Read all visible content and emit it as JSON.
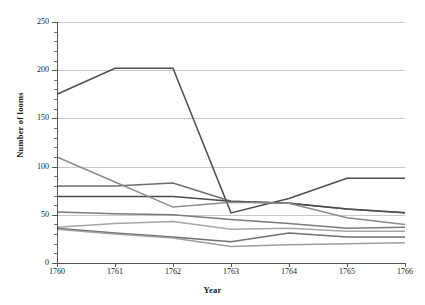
{
  "chart_data": {
    "type": "line",
    "title": "",
    "xlabel": "Year",
    "ylabel": "Number of looms",
    "categories": [
      1760,
      1761,
      1762,
      1763,
      1764,
      1765,
      1766
    ],
    "x_tick_labels": [
      "1760",
      "1761",
      "1762",
      "1763",
      "1764",
      "1765",
      "1766"
    ],
    "y_tick_labels": [
      "0",
      "50",
      "100",
      "150",
      "200",
      "250"
    ],
    "y_ticks": [
      0,
      50,
      100,
      150,
      200,
      250
    ],
    "ylim": [
      0,
      250
    ],
    "xlim": [
      1760,
      1766
    ],
    "grid": "horizontal",
    "legend": "none",
    "series": [
      {
        "name": "series-1",
        "color": "#4d4d4d",
        "values": [
          175,
          202,
          202,
          52,
          67,
          88,
          88
        ]
      },
      {
        "name": "series-2",
        "color": "#6e6e6e",
        "values": [
          80,
          80,
          83,
          64,
          62,
          56,
          52
        ]
      },
      {
        "name": "series-3",
        "color": "#4a4a4a",
        "values": [
          69,
          69,
          69,
          64,
          62,
          56,
          52
        ]
      },
      {
        "name": "series-4",
        "color": "#8c8c8c",
        "values": [
          110,
          84,
          58,
          63,
          62,
          47,
          40
        ]
      },
      {
        "name": "series-5",
        "color": "#7a7a7a",
        "values": [
          53,
          51,
          50,
          45,
          41,
          36,
          37
        ]
      },
      {
        "name": "series-6",
        "color": "#a6a6a6",
        "values": [
          37,
          41,
          43,
          35,
          36,
          33,
          33
        ]
      },
      {
        "name": "series-7",
        "color": "#707070",
        "values": [
          36,
          31,
          27,
          22,
          31,
          27,
          27
        ]
      },
      {
        "name": "series-8",
        "color": "#9e9e9e",
        "values": [
          35,
          30,
          26,
          17,
          19,
          20,
          21
        ]
      }
    ]
  }
}
